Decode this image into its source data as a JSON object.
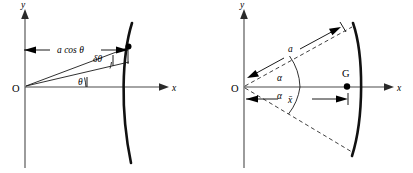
{
  "figure": {
    "background_color": "#ffffff",
    "ink_color": "#000000",
    "axis_color": "#4a4a4a",
    "panels": [
      {
        "id": "left-panel",
        "name": "element-of-arc-diagram",
        "origin_label": "O",
        "y_axis_label": "y",
        "x_axis_label": "x",
        "labels": [
          {
            "id": "a-cos-theta",
            "text": "a cos θ",
            "role": "dimension-label"
          },
          {
            "id": "delta-theta",
            "text": "δθ",
            "role": "angle-label"
          },
          {
            "id": "theta",
            "text": "θ",
            "role": "angle-label"
          }
        ],
        "marked_points": [
          {
            "id": "arc-point",
            "label": ""
          }
        ]
      },
      {
        "id": "right-panel",
        "name": "circular-arc-centroid-diagram",
        "origin_label": "O",
        "y_axis_label": "y",
        "x_axis_label": "x",
        "centroid_label": "G",
        "labels": [
          {
            "id": "radius-a",
            "text": "a",
            "role": "radius-label"
          },
          {
            "id": "alpha-upper",
            "text": "α",
            "role": "angle-label"
          },
          {
            "id": "alpha-lower",
            "text": "α",
            "role": "angle-label"
          },
          {
            "id": "x-bar",
            "text": "x̄",
            "role": "dimension-label"
          }
        ],
        "marked_points": [
          {
            "id": "centroid-point",
            "label": "G"
          }
        ]
      }
    ]
  }
}
